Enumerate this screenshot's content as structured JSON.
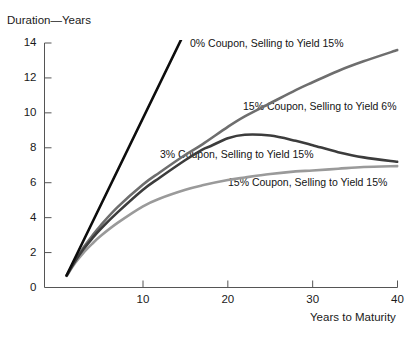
{
  "chart_data": {
    "type": "line",
    "title": "",
    "xlabel": "Years to Maturity",
    "ylabel": "Duration—Years",
    "xlim": [
      0,
      41
    ],
    "ylim": [
      0,
      14.6
    ],
    "grid": false,
    "legend_position": "inline-annotations",
    "xticks": [
      "10",
      "20",
      "30",
      "40"
    ],
    "xtick_values": [
      10,
      20,
      30,
      40
    ],
    "yticks": [
      "0",
      "2",
      "4",
      "6",
      "8",
      "10",
      "12",
      "14"
    ],
    "ytick_values": [
      0,
      2,
      4,
      6,
      8,
      10,
      12,
      14
    ],
    "x": [
      1,
      2,
      3,
      4,
      5,
      7,
      10,
      12,
      15,
      17,
      20,
      22,
      25,
      28,
      30,
      33,
      36,
      40
    ],
    "series": [
      {
        "name": "0% Coupon, Selling to Yield 15%",
        "color": "#0d0d0d",
        "width": 2.6,
        "label_x": 190,
        "label_y": 37,
        "x": [
          1,
          2,
          3,
          4,
          5,
          7,
          10,
          12,
          15,
          16
        ],
        "values": [
          0.7,
          1.7,
          2.7,
          3.7,
          4.7,
          6.7,
          9.7,
          11.7,
          14.7,
          15.7
        ],
        "values_note": "Straight line, duration equals maturity for zero coupon; drawn from (1,0.7) to (16,15.7), truncated at plot top"
      },
      {
        "name": "15% Coupon, Selling to Yield 6%",
        "color": "#6e6e6e",
        "width": 2.6,
        "label_x": 243,
        "label_y": 100,
        "x": [
          1,
          2,
          3,
          4,
          5,
          7,
          10,
          12,
          15,
          17,
          20,
          22,
          25,
          28,
          30,
          33,
          36,
          40
        ],
        "values": [
          0.68,
          1.55,
          2.3,
          2.95,
          3.55,
          4.6,
          5.9,
          6.6,
          7.6,
          8.2,
          9.2,
          9.8,
          10.55,
          11.3,
          11.75,
          12.4,
          12.95,
          13.6
        ]
      },
      {
        "name": "3% Coupon, Selling to Yield 15%",
        "color": "#3c3c3c",
        "width": 2.6,
        "label_x": 160,
        "label_y": 148,
        "x": [
          1,
          2,
          3,
          4,
          5,
          7,
          10,
          12,
          15,
          17,
          18,
          20,
          22,
          25,
          28,
          30,
          33,
          36,
          40
        ],
        "values": [
          0.68,
          1.5,
          2.2,
          2.8,
          3.35,
          4.3,
          5.6,
          6.3,
          7.3,
          7.9,
          8.1,
          8.55,
          8.75,
          8.7,
          8.4,
          8.15,
          7.75,
          7.45,
          7.2
        ]
      },
      {
        "name": "15% Coupon, Selling to Yield 15%",
        "color": "#9a9a9a",
        "width": 2.6,
        "label_x": 228,
        "label_y": 176,
        "x": [
          1,
          2,
          3,
          4,
          5,
          7,
          10,
          12,
          15,
          17,
          20,
          22,
          25,
          28,
          30,
          33,
          36,
          40
        ],
        "values": [
          0.66,
          1.4,
          2.0,
          2.5,
          2.95,
          3.7,
          4.65,
          5.1,
          5.6,
          5.85,
          6.15,
          6.3,
          6.5,
          6.65,
          6.7,
          6.8,
          6.9,
          6.95
        ]
      }
    ]
  }
}
